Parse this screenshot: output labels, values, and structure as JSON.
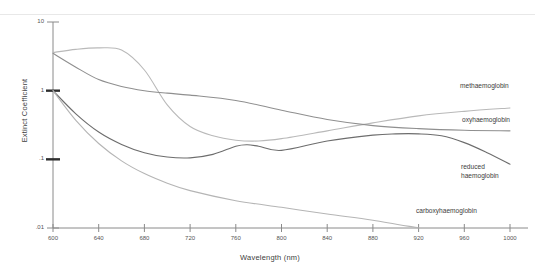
{
  "chart_data": {
    "type": "line",
    "title": "",
    "xlabel": "Wavelength (nm)",
    "ylabel": "Extinct Coefficient",
    "yscale": "log",
    "xlim": [
      600,
      1000
    ],
    "ylim": [
      0.01,
      10
    ],
    "grid": false,
    "legend_position": "inline-right",
    "xticks": [
      "600",
      "640",
      "680",
      "720",
      "760",
      "800",
      "840",
      "880",
      "920",
      "960",
      "1000"
    ],
    "yticks": [
      "10",
      "1",
      ".1",
      ".01"
    ],
    "ytick_values": [
      10,
      1,
      0.1,
      0.01
    ],
    "series": [
      {
        "name": "methaemoglobin",
        "color": "#b9b9b9",
        "label": "methaemoglobin",
        "x": [
          600,
          620,
          640,
          660,
          680,
          700,
          720,
          740,
          760,
          780,
          800,
          840,
          880,
          920,
          960,
          1000
        ],
        "y": [
          3.6,
          4.0,
          4.2,
          3.9,
          2.0,
          0.62,
          0.3,
          0.22,
          0.19,
          0.185,
          0.2,
          0.26,
          0.34,
          0.43,
          0.5,
          0.56
        ]
      },
      {
        "name": "oxyhaemoglobin",
        "color": "#8f8f8f",
        "label": "oxyhaemoglobin",
        "x": [
          600,
          620,
          640,
          660,
          680,
          700,
          720,
          760,
          800,
          840,
          880,
          920,
          960,
          1000
        ],
        "y": [
          3.5,
          2.2,
          1.45,
          1.15,
          1.0,
          0.92,
          0.86,
          0.72,
          0.52,
          0.38,
          0.31,
          0.28,
          0.265,
          0.26
        ]
      },
      {
        "name": "reduced haemoglobin",
        "color": "#6d6d6d",
        "label": "reduced\nhaemoglobin",
        "label_line1": "reduced",
        "label_line2": "haemoglobin",
        "x": [
          600,
          620,
          640,
          660,
          680,
          700,
          720,
          740,
          760,
          770,
          780,
          800,
          840,
          880,
          900,
          920,
          940,
          960,
          980,
          1000
        ],
        "y": [
          1.0,
          0.46,
          0.25,
          0.165,
          0.125,
          0.108,
          0.105,
          0.118,
          0.155,
          0.163,
          0.155,
          0.135,
          0.185,
          0.225,
          0.235,
          0.235,
          0.22,
          0.175,
          0.125,
          0.085
        ]
      },
      {
        "name": "carboxyhaemoglobin",
        "color": "#b5b5b5",
        "label": "carboxyhaemoglobin",
        "x": [
          600,
          620,
          640,
          660,
          680,
          700,
          720,
          760,
          800,
          840,
          880,
          920
        ],
        "y": [
          1.0,
          0.37,
          0.17,
          0.095,
          0.062,
          0.045,
          0.035,
          0.025,
          0.02,
          0.016,
          0.013,
          0.01
        ]
      }
    ]
  },
  "axis": {
    "y_title": "Extinct Coefficient",
    "x_title": "Wavelength (nm)"
  }
}
